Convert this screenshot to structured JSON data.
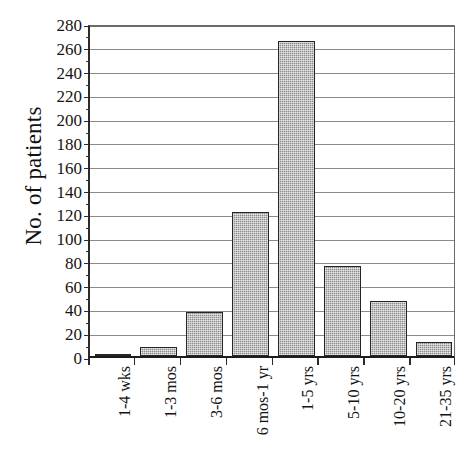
{
  "chart_data": {
    "type": "bar",
    "title": "",
    "xlabel": "",
    "ylabel": "No. of patients",
    "ylim": [
      0,
      280
    ],
    "ytick_step": 20,
    "grid": true,
    "legend": null,
    "categories": [
      "1-4 wks",
      "1-3  mos",
      "3-6 mos",
      "6 mos-1 yr",
      "1-5 yrs",
      "5-10 yrs",
      "10-20 yrs",
      "21-35 yrs"
    ],
    "values": [
      2,
      8,
      37,
      121,
      265,
      76,
      46,
      12
    ],
    "ytick_labels": [
      "0",
      "20",
      "40",
      "60",
      "80",
      "100",
      "120",
      "140",
      "160",
      "180",
      "200",
      "220",
      "240",
      "260",
      "280"
    ],
    "colors": {
      "bar_fill": "#8c8c8c",
      "bar_border": "#262626",
      "gridline": "#8a8a8a",
      "axis": "#1c1c1c",
      "text": "#111111",
      "background": "#ffffff"
    }
  }
}
